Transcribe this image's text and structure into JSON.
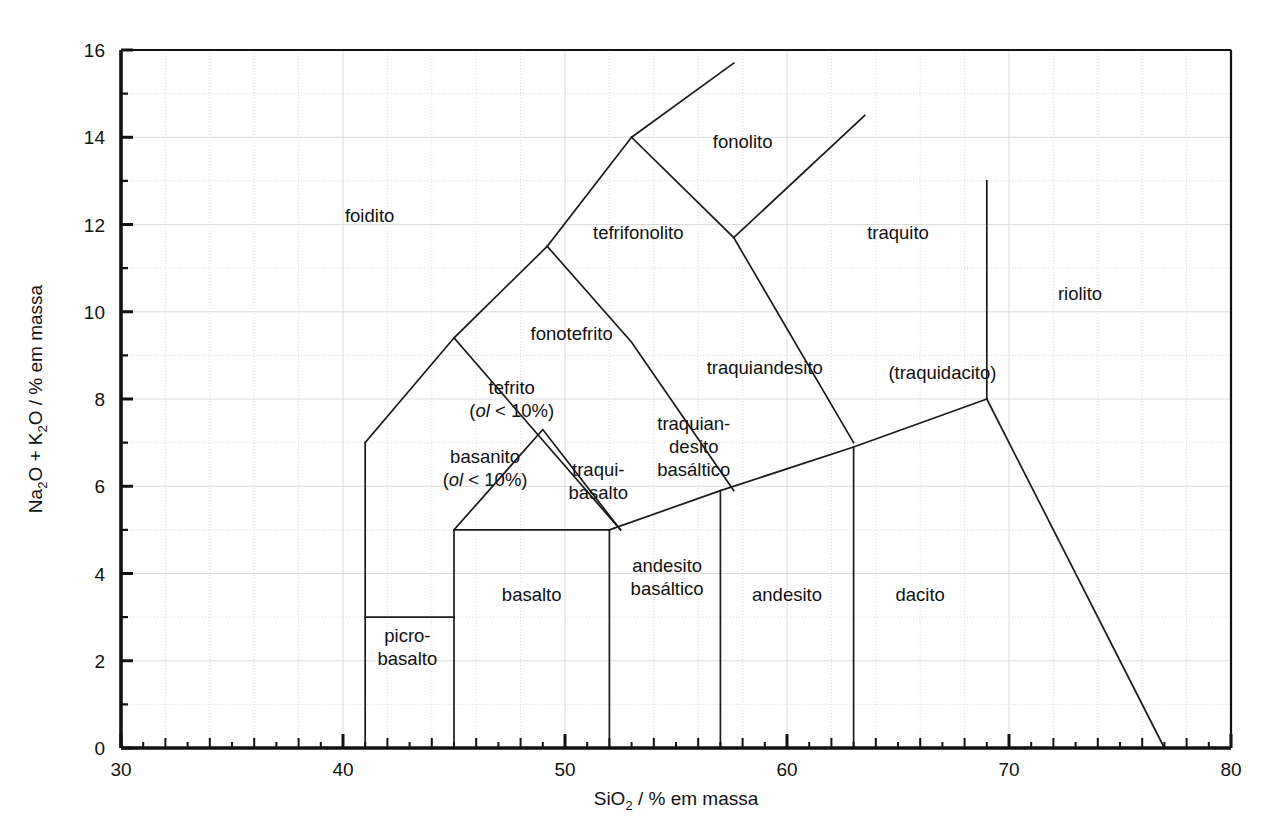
{
  "figure": {
    "type": "tas-classification-diagram",
    "language": "pt-BR",
    "background_color": "#ffffff",
    "line_color": "#1a1a1a",
    "grid_color": "#dcdcdc"
  },
  "axes": {
    "x": {
      "label_main": "SiO",
      "label_sub": "2",
      "label_tail": " / % em massa",
      "full_label": "SiO2 / % em massa",
      "min": 30,
      "max": 80,
      "major_step": 10,
      "minor_step": 2,
      "ticks": [
        "30",
        "40",
        "50",
        "60",
        "70",
        "80"
      ],
      "tick_values": [
        30,
        40,
        50,
        60,
        70,
        80
      ]
    },
    "y": {
      "label_a": "Na",
      "label_a_sub": "2",
      "label_b": "O + K",
      "label_b_sub": "2",
      "label_c": "O / % em massa",
      "full_label": "Na2O + K2O / % em massa",
      "min": 0,
      "max": 16,
      "major_step": 2,
      "minor_step": 1,
      "ticks": [
        "0",
        "2",
        "4",
        "6",
        "8",
        "10",
        "12",
        "14",
        "16"
      ],
      "tick_values": [
        0,
        2,
        4,
        6,
        8,
        10,
        12,
        14,
        16
      ]
    }
  },
  "chart_data": {
    "type": "line",
    "title": "",
    "xlabel": "SiO2 / % em massa",
    "ylabel": "Na2O + K2O / % em massa",
    "xlim": [
      30,
      80
    ],
    "ylim": [
      0,
      16
    ],
    "grid": true,
    "legend": "none",
    "boundaries": [
      {
        "name": "picrobasalt-top",
        "points": [
          [
            41,
            3
          ],
          [
            45,
            3
          ]
        ]
      },
      {
        "name": "picrobasalt-left",
        "points": [
          [
            41,
            0
          ],
          [
            41,
            7
          ]
        ]
      },
      {
        "name": "basalt-right",
        "points": [
          [
            45,
            0
          ],
          [
            45,
            5
          ]
        ]
      },
      {
        "name": "alkali-floor-45-52",
        "points": [
          [
            45,
            5
          ],
          [
            52,
            5
          ]
        ]
      },
      {
        "name": "basaltic-andesite-left",
        "points": [
          [
            52,
            0
          ],
          [
            52,
            5
          ]
        ]
      },
      {
        "name": "basaltic-andesite-right",
        "points": [
          [
            57,
            0
          ],
          [
            57,
            5.9
          ]
        ]
      },
      {
        "name": "andesite-right",
        "points": [
          [
            63,
            0
          ],
          [
            63,
            6.9
          ]
        ]
      },
      {
        "name": "alkali-slope-52-69",
        "points": [
          [
            52,
            5
          ],
          [
            57,
            5.9
          ],
          [
            63,
            6.9
          ],
          [
            69,
            8
          ]
        ]
      },
      {
        "name": "dacite-rhyolite-divider",
        "points": [
          [
            69,
            13
          ],
          [
            69,
            8
          ]
        ]
      },
      {
        "name": "rhyolite-lower",
        "points": [
          [
            69,
            8
          ],
          [
            77,
            0
          ]
        ]
      },
      {
        "name": "basanite-tephrite-left",
        "points": [
          [
            41,
            7
          ],
          [
            45,
            9.4
          ]
        ]
      },
      {
        "name": "tephrite-phonotephrite",
        "points": [
          [
            45,
            9.4
          ],
          [
            49.2,
            11.5
          ]
        ]
      },
      {
        "name": "phonotephrite-tephriphonolite",
        "points": [
          [
            49.2,
            11.5
          ],
          [
            53,
            14
          ]
        ]
      },
      {
        "name": "tephriphonolite-phonolite",
        "points": [
          [
            53,
            14
          ],
          [
            57.6,
            15.7
          ]
        ]
      },
      {
        "name": "foidite-upper-left",
        "points": [
          [
            45,
            9.4
          ],
          [
            52.5,
            5
          ]
        ]
      },
      {
        "name": "tephrite-trachybasalt-diag",
        "points": [
          [
            49.2,
            11.5
          ],
          [
            53,
            9.3
          ],
          [
            57.6,
            5.9
          ]
        ]
      },
      {
        "name": "phonolite-trachyte-diag",
        "points": [
          [
            53,
            14
          ],
          [
            57.6,
            11.7
          ],
          [
            63,
            7
          ]
        ]
      },
      {
        "name": "trachyte-upper",
        "points": [
          [
            57.6,
            11.7
          ],
          [
            63.5,
            14.5
          ]
        ]
      },
      {
        "name": "trachybasalt-apex",
        "points": [
          [
            45,
            5
          ],
          [
            49,
            7.3
          ],
          [
            52.5,
            5
          ]
        ]
      }
    ]
  },
  "fields": [
    {
      "id": "foidito",
      "label": "foidito",
      "x": 41.2,
      "y": 12.2,
      "lines": [
        "foidito"
      ]
    },
    {
      "id": "fonolito",
      "label": "fonolito",
      "x": 58.0,
      "y": 13.9,
      "lines": [
        "fonolito"
      ]
    },
    {
      "id": "tefrifonolito",
      "label": "tefrifonolito",
      "x": 53.3,
      "y": 11.8,
      "lines": [
        "tefrifonolito"
      ]
    },
    {
      "id": "traquito",
      "label": "traquito",
      "x": 65.0,
      "y": 11.8,
      "lines": [
        "traquito"
      ]
    },
    {
      "id": "riolito",
      "label": "riolito",
      "x": 73.2,
      "y": 10.4,
      "lines": [
        "riolito"
      ]
    },
    {
      "id": "fonotefrito",
      "label": "fonotefrito",
      "x": 50.3,
      "y": 9.5,
      "lines": [
        "fonotefrito"
      ]
    },
    {
      "id": "traquiandesito",
      "label": "traquiandesito",
      "x": 59.0,
      "y": 8.7,
      "lines": [
        "traquiandesito"
      ]
    },
    {
      "id": "traquidacito",
      "label": "(traquidacito)",
      "x": 67.0,
      "y": 8.6,
      "lines": [
        "(traquidacito)"
      ]
    },
    {
      "id": "tefrito",
      "label": "tefrito (ol < 10%)",
      "x": 47.6,
      "y": 8.0,
      "lines": [
        "tefrito",
        "(ol< 10%)"
      ]
    },
    {
      "id": "basanito",
      "label": "basanito (ol < 10%)",
      "x": 46.4,
      "y": 6.4,
      "lines": [
        "basanito",
        "(ol< 10%)"
      ]
    },
    {
      "id": "traquibasalto",
      "label": "traqui-basalto",
      "x": 51.5,
      "y": 6.1,
      "lines": [
        "traqui-",
        "basalto"
      ]
    },
    {
      "id": "traquiandesito-bas",
      "label": "traquiandesito basáltico",
      "x": 55.8,
      "y": 6.9,
      "lines": [
        "traquian-",
        "desito",
        "basáltico"
      ]
    },
    {
      "id": "picro-basalto",
      "label": "picro-basalto",
      "x": 42.9,
      "y": 2.3,
      "lines": [
        "picro-",
        "basalto"
      ]
    },
    {
      "id": "basalto",
      "label": "basalto",
      "x": 48.5,
      "y": 3.5,
      "lines": [
        "basalto"
      ]
    },
    {
      "id": "andesito-basaltico",
      "label": "andesito basáltico",
      "x": 54.6,
      "y": 3.9,
      "lines": [
        "andesito",
        "basáltico"
      ]
    },
    {
      "id": "andesito",
      "label": "andesito",
      "x": 60.0,
      "y": 3.5,
      "lines": [
        "andesito"
      ]
    },
    {
      "id": "dacito",
      "label": "dacito",
      "x": 66.0,
      "y": 3.5,
      "lines": [
        "dacito"
      ]
    }
  ]
}
